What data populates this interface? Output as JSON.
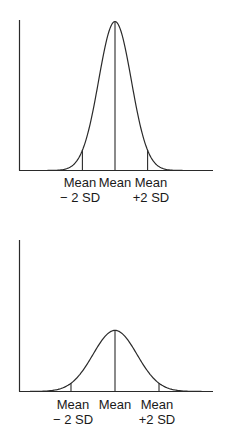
{
  "chart_data": [
    {
      "type": "line",
      "title": "",
      "subtitle": "Narrow normal distribution (small standard deviation)",
      "xlabel": "",
      "ylabel": "",
      "grid": false,
      "legend": null,
      "x_tick_labels": [
        "Mean\n− 2 SD",
        "Mean",
        "Mean\n+2 SD"
      ],
      "distribution": {
        "mean": 0,
        "sd": 1,
        "relative_peak_height": 1.0
      },
      "markers": [
        {
          "label_line1": "Mean",
          "label_line2": "− 2 SD",
          "x_sd": -2
        },
        {
          "label_line1": "Mean",
          "label_line2": "",
          "x_sd": 0
        },
        {
          "label_line1": "Mean",
          "label_line2": "+2 SD",
          "x_sd": 2
        }
      ]
    },
    {
      "type": "line",
      "title": "",
      "subtitle": "Wide normal distribution (large standard deviation)",
      "xlabel": "",
      "ylabel": "",
      "grid": false,
      "legend": null,
      "x_tick_labels": [
        "Mean\n− 2 SD",
        "Mean",
        "Mean\n+2 SD"
      ],
      "distribution": {
        "mean": 0,
        "sd": 1.35,
        "relative_peak_height": 0.41
      },
      "markers": [
        {
          "label_line1": "Mean",
          "label_line2": "− 2 SD",
          "x_sd": -2
        },
        {
          "label_line1": "Mean",
          "label_line2": "",
          "x_sd": 0
        },
        {
          "label_line1": "Mean",
          "label_line2": "+2 SD",
          "x_sd": 2
        }
      ]
    }
  ],
  "panels": {
    "top": {
      "label_minus_1": "Mean",
      "label_minus_2": "− 2 SD",
      "label_mean": "Mean",
      "label_plus_1": "Mean",
      "label_plus_2": "+2 SD"
    },
    "bottom": {
      "label_minus_1": "Mean",
      "label_minus_2": "− 2 SD",
      "label_mean": "Mean",
      "label_plus_1": "Mean",
      "label_plus_2": "+2 SD"
    }
  },
  "colors": {
    "line": "#2a2a2a",
    "axis": "#2a2a2a",
    "background": "#ffffff"
  }
}
